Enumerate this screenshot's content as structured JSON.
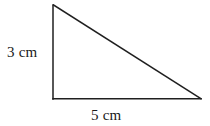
{
  "figure": {
    "name": "right-triangle-with-dimension-labels",
    "canvas": {
      "width": 210,
      "height": 126,
      "background": "#ffffff"
    },
    "stroke": {
      "color": "#1f1f1f",
      "width": 1.5
    },
    "shape": {
      "type": "right-triangle",
      "vertices": {
        "apex_top_left": {
          "x": 53,
          "y": 5
        },
        "right_angle_bottom_left": {
          "x": 53,
          "y": 99
        },
        "bottom_right": {
          "x": 201,
          "y": 99
        }
      },
      "edges": [
        {
          "name": "vertical-leg",
          "from": "apex_top_left",
          "to": "right_angle_bottom_left"
        },
        {
          "name": "horizontal-leg",
          "from": "right_angle_bottom_left",
          "to": "bottom_right"
        },
        {
          "name": "hypotenuse",
          "from": "apex_top_left",
          "to": "bottom_right"
        }
      ]
    },
    "labels": {
      "vertical_leg": "3 cm",
      "horizontal_leg": "5 cm"
    }
  }
}
